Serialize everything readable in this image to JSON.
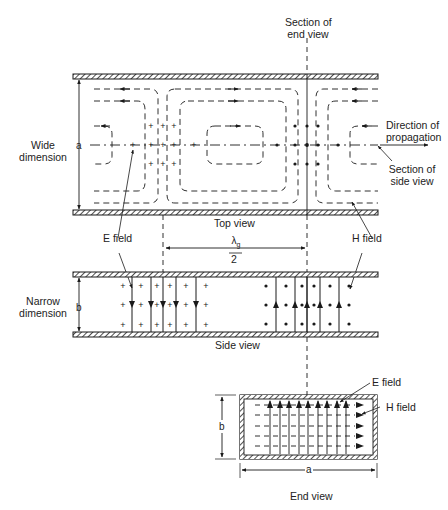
{
  "figure": {
    "labels": {
      "section_end_view_line1": "Section of",
      "section_end_view_line2": "end view",
      "direction_line1": "Direction of",
      "direction_line2": "propagation",
      "section_side_view_line1": "Section of",
      "section_side_view_line2": "side view",
      "wide_dimension_line1": "Wide",
      "wide_dimension_line2": "dimension",
      "narrow_dimension_line1": "Narrow",
      "narrow_dimension_line2": "dimension",
      "top_view": "Top view",
      "side_view": "Side view",
      "end_view": "End view",
      "e_field_top": "E field",
      "h_field_top": "H field",
      "e_field_end": "E field",
      "h_field_end": "H field",
      "lambda_num": "λ",
      "lambda_sub": "g",
      "lambda_den": "2",
      "dim_a": "a",
      "dim_b": "b",
      "dim_a_end": "a",
      "dim_b_end": "b"
    },
    "symbols": {
      "e_into_page": "+",
      "e_out_of_page": "•"
    },
    "colors": {
      "ink": "#1a1a1a",
      "background": "#ffffff"
    }
  }
}
